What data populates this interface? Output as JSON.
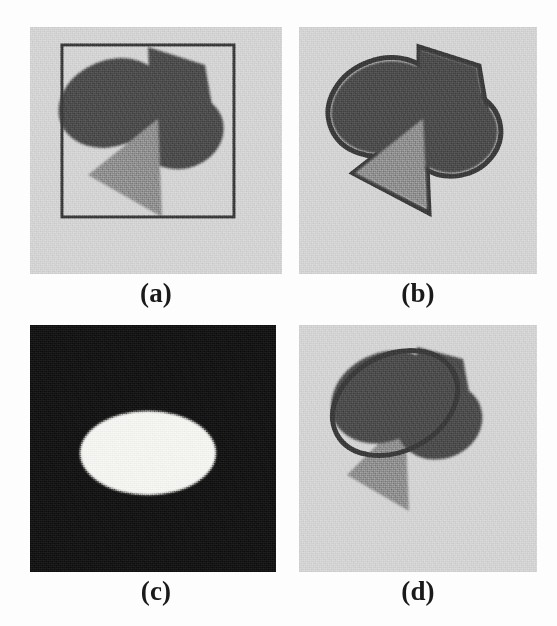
{
  "figure": {
    "kind": "multi-panel-image-figure",
    "background_color": "#fdfdfd",
    "panel_count": 4,
    "columns": 2,
    "rows": 2
  },
  "palette": {
    "image_background_gray": "#d2d2d2",
    "dark_object_gray": "#4b4b4b",
    "mid_object_gray": "#8c8c8c",
    "contour_color": "#3a3a3a",
    "mask_background": "#151515",
    "mask_foreground": "#f2f2ef",
    "caption_color": "#1a1a1a"
  },
  "panels": [
    {
      "id": "a",
      "caption": "(a)",
      "role": "noisy-input-with-initial-contour",
      "x": 30,
      "y": 27,
      "width": 252,
      "height": 247,
      "background": "#d2d2d2",
      "noise": "speckle",
      "contour": {
        "shape": "rectangle",
        "x": 32,
        "y": 18,
        "width": 172,
        "height": 172,
        "stroke": "#3a3a3a",
        "stroke_width": 3,
        "label": "initial-rectangular-contour"
      },
      "objects": [
        {
          "name": "dark-ellipse-left",
          "type": "ellipse",
          "cx": 82,
          "cy": 76,
          "rx": 55,
          "ry": 43,
          "rotate": -22,
          "fill": "#4b4b4b"
        },
        {
          "name": "dark-quadrilateral",
          "type": "polygon",
          "points": "118,20 175,38 182,78 150,96 120,72",
          "fill": "#4b4b4b"
        },
        {
          "name": "dark-ellipse-right",
          "type": "ellipse",
          "cx": 150,
          "cy": 104,
          "rx": 44,
          "ry": 38,
          "rotate": -12,
          "fill": "#4b4b4b"
        },
        {
          "name": "gray-triangle",
          "type": "polygon",
          "points": "58,148 128,92 132,190",
          "fill": "#8c8c8c"
        }
      ]
    },
    {
      "id": "b",
      "caption": "(b)",
      "role": "intermediate-contour-overlay",
      "x": 299,
      "y": 27,
      "width": 238,
      "height": 247,
      "background": "#d2d2d2",
      "noise": "speckle",
      "contour": {
        "shape": "merged-object-outline",
        "stroke": "#3a3a3a",
        "stroke_width": 4,
        "label": "evolved-contour-around-all-objects"
      },
      "objects": [
        {
          "name": "dark-ellipse-left",
          "type": "ellipse",
          "cx": 86,
          "cy": 80,
          "rx": 55,
          "ry": 45,
          "rotate": -20,
          "fill": "#4b4b4b"
        },
        {
          "name": "dark-quadrilateral",
          "type": "polygon",
          "points": "120,22 178,40 186,84 152,100 122,74",
          "fill": "#4b4b4b"
        },
        {
          "name": "dark-ellipse-right",
          "type": "ellipse",
          "cx": 154,
          "cy": 106,
          "rx": 45,
          "ry": 40,
          "rotate": -10,
          "fill": "#4b4b4b"
        },
        {
          "name": "gray-triangle",
          "type": "polygon",
          "points": "56,146 124,92 128,182",
          "fill": "#8c8c8c"
        }
      ]
    },
    {
      "id": "c",
      "caption": "(c)",
      "role": "binary-segmentation-mask",
      "x": 30,
      "y": 325,
      "width": 246,
      "height": 247,
      "background": "#151515",
      "noise": "dense-speckle",
      "objects": [
        {
          "name": "white-ellipse-mask",
          "type": "ellipse",
          "cx": 118,
          "cy": 128,
          "rx": 68,
          "ry": 42,
          "rotate": 0,
          "fill": "#f2f2ef"
        }
      ]
    },
    {
      "id": "d",
      "caption": "(d)",
      "role": "final-contour-overlay",
      "x": 299,
      "y": 325,
      "width": 238,
      "height": 247,
      "background": "#d2d2d2",
      "noise": "speckle",
      "contour": {
        "shape": "ellipse",
        "cx": 96,
        "cy": 78,
        "rx": 66,
        "ry": 48,
        "rotate": -28,
        "stroke": "#3a3a3a",
        "stroke_width": 4,
        "label": "final-elliptical-contour"
      },
      "objects": [
        {
          "name": "dark-ellipse-left",
          "type": "ellipse",
          "cx": 86,
          "cy": 72,
          "rx": 56,
          "ry": 44,
          "rotate": -26,
          "fill": "#4b4b4b"
        },
        {
          "name": "dark-quadrilateral",
          "type": "polygon",
          "points": "118,22 164,34 170,66 142,86 118,64",
          "fill": "#4b4b4b"
        },
        {
          "name": "dark-ellipse-right",
          "type": "ellipse",
          "cx": 140,
          "cy": 96,
          "rx": 44,
          "ry": 38,
          "rotate": -18,
          "fill": "#4b4b4b"
        },
        {
          "name": "gray-triangle",
          "type": "polygon",
          "points": "48,150 106,92 110,186",
          "fill": "#8c8c8c"
        }
      ]
    }
  ],
  "captions": [
    {
      "text": "(a)",
      "x": 110,
      "y": 276,
      "width": 92
    },
    {
      "text": "(b)",
      "x": 372,
      "y": 276,
      "width": 92
    },
    {
      "text": "(c)",
      "x": 110,
      "y": 574,
      "width": 92
    },
    {
      "text": "(d)",
      "x": 372,
      "y": 574,
      "width": 92
    }
  ]
}
